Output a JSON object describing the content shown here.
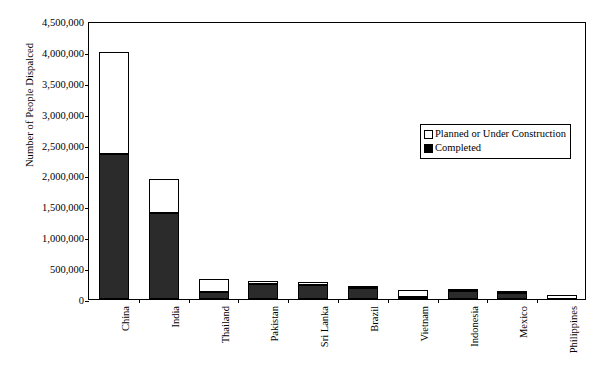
{
  "chart_data": {
    "type": "bar",
    "stacked": true,
    "title": "",
    "xlabel": "",
    "ylabel": "Number of People Dispalced",
    "ylim": [
      0,
      4500000
    ],
    "ytick_step": 500000,
    "ytick_labels": [
      "4,500,000",
      "4,000,000",
      "3,500,000",
      "3,000,000",
      "2,500,000",
      "2,000,000",
      "1,500,000",
      "1,000,000",
      "500,000",
      "0"
    ],
    "ytick_values": [
      4500000,
      4000000,
      3500000,
      3000000,
      2500000,
      2000000,
      1500000,
      1000000,
      500000,
      0
    ],
    "grid": false,
    "legend_position": "upper-center-right",
    "categories": [
      "China",
      "India",
      "Thailand",
      "Pakistan",
      "Sri Lanka",
      "Brazil",
      "Vietnam",
      "Indonesia",
      "Mexico",
      "Philippines"
    ],
    "series": [
      {
        "name": "Completed",
        "color": "#2b2b2b",
        "values": [
          2350000,
          1400000,
          110000,
          250000,
          220000,
          175000,
          35000,
          130000,
          105000,
          0
        ]
      },
      {
        "name": "Planned or Under Construction",
        "color": "#ffffff",
        "values": [
          1650000,
          550000,
          215000,
          45000,
          50000,
          40000,
          115000,
          20000,
          10000,
          60000
        ]
      }
    ],
    "totals": [
      4000000,
      1950000,
      325000,
      295000,
      270000,
      215000,
      150000,
      150000,
      115000,
      60000
    ]
  },
  "legend": {
    "items": [
      {
        "label": "Planned or Under Construction",
        "swatch": "planned"
      },
      {
        "label": "Completed",
        "swatch": "completed"
      }
    ]
  }
}
